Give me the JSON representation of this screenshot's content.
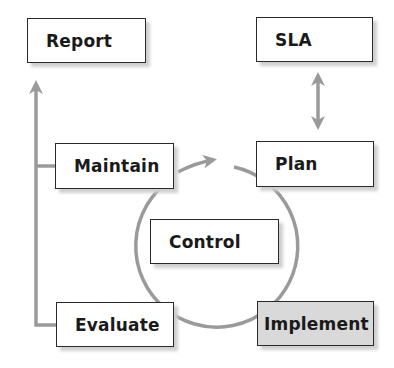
{
  "diagram": {
    "title": "",
    "colors": {
      "connector": "#9a9a9a",
      "box_border": "#2a2a2a",
      "box_fill": "#ffffff",
      "highlight_fill": "#d9d9d9",
      "text": "#1a1a1a"
    },
    "nodes": {
      "report": {
        "label": "Report"
      },
      "sla": {
        "label": "SLA"
      },
      "maintain": {
        "label": "Maintain"
      },
      "plan": {
        "label": "Plan"
      },
      "control": {
        "label": "Control"
      },
      "evaluate": {
        "label": "Evaluate"
      },
      "implement": {
        "label": "Implement",
        "highlighted": true
      }
    },
    "edges": [
      {
        "from": "Evaluate",
        "to": "Report",
        "type": "arrow",
        "note": "left vertical line"
      },
      {
        "from": "Maintain",
        "to": "Report",
        "type": "line-join"
      },
      {
        "from": "SLA",
        "to": "Plan",
        "type": "double-arrow"
      },
      {
        "from": "Maintain",
        "to": "Plan",
        "type": "cycle-arrow"
      },
      {
        "from": "Plan",
        "to": "Implement",
        "type": "cycle-arc"
      },
      {
        "from": "Implement",
        "to": "Evaluate",
        "type": "cycle-arc"
      },
      {
        "from": "Evaluate",
        "to": "Maintain",
        "type": "cycle-arc"
      }
    ]
  }
}
